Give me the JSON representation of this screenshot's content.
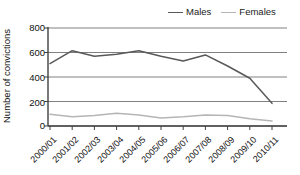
{
  "chart_data": {
    "type": "line",
    "title": "",
    "xlabel": "",
    "ylabel": "Number of convictions",
    "ylim": [
      0,
      800
    ],
    "yticks": [
      0,
      200,
      400,
      600,
      800
    ],
    "grid": true,
    "legend_position": "top-right",
    "categories": [
      "2000/01",
      "2001/02",
      "2002/03",
      "2003/04",
      "2004/05",
      "2005/06",
      "2006/07",
      "2007/08",
      "2008/09",
      "2009/10",
      "2010/11"
    ],
    "series": [
      {
        "name": "Males",
        "color": "#595959",
        "values": [
          510,
          615,
          570,
          585,
          615,
          570,
          530,
          580,
          490,
          390,
          185
        ]
      },
      {
        "name": "Females",
        "color": "#b5b5b5",
        "values": [
          95,
          75,
          85,
          105,
          90,
          65,
          75,
          90,
          85,
          60,
          40
        ]
      }
    ]
  },
  "legend": {
    "entries": [
      {
        "label": "Males"
      },
      {
        "label": "Females"
      }
    ]
  },
  "axes": {
    "y_title": "Number of convictions",
    "y_tick_labels": [
      "800",
      "600",
      "400",
      "200",
      "0"
    ]
  },
  "colors": {
    "males_line": "#595959",
    "females_line": "#b5b5b5",
    "gridline": "#808080",
    "axis": "#404040",
    "background": "#ffffff"
  }
}
